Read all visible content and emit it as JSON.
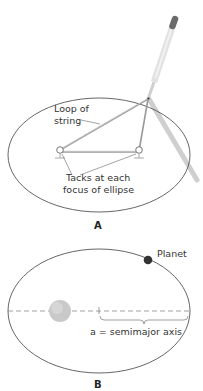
{
  "panel_a": {
    "label": "A",
    "annotations": {
      "loop_line1": "Loop of",
      "loop_line2": "string",
      "tacks_line1": "Tacks at each",
      "tacks_line2": "focus of ellipse"
    }
  },
  "panel_b": {
    "label": "B",
    "annotations": {
      "planet": "Planet",
      "semimajor": "a = semimajor axis"
    }
  },
  "colors": {
    "ellipse_stroke": "#555555",
    "string": "#9a9a9a",
    "pencil": "#d9d9d9",
    "pencil_shadow": "#cccccc",
    "eraser": "#666666",
    "sun": "#c8c8c8",
    "planet": "#333333",
    "axis_dash": "#888888"
  }
}
